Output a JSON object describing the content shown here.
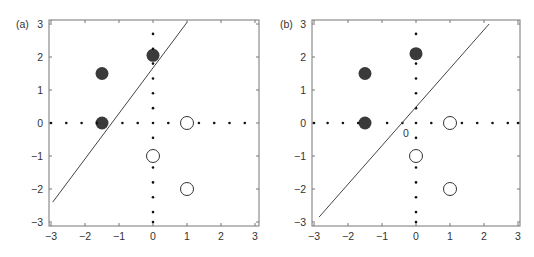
{
  "chart_data": [
    {
      "type": "scatter",
      "panel_label": "(a)",
      "title": "",
      "xlabel": "",
      "ylabel": "",
      "xlim": [
        -3,
        3
      ],
      "ylim": [
        -3,
        3
      ],
      "xticks": [
        "-3",
        "-2",
        "-1",
        "0",
        "1",
        "2",
        "3"
      ],
      "yticks": [
        "3",
        "2",
        "1",
        "0",
        "-1",
        "-2",
        "-3"
      ],
      "grid": false,
      "series": [
        {
          "name": "filled",
          "marker": "filled-circle",
          "color": "#3a3a3a",
          "points": [
            [
              -1.5,
              1.5
            ],
            [
              0,
              2.05
            ],
            [
              -1.5,
              0
            ]
          ]
        },
        {
          "name": "open",
          "marker": "open-circle",
          "color": "#333333",
          "points": [
            [
              1,
              0
            ],
            [
              0,
              -1
            ],
            [
              1,
              -2
            ]
          ]
        },
        {
          "name": "dotted-x-axis",
          "marker": "dot",
          "points": [
            [
              -3,
              0
            ],
            [
              -2.55,
              0
            ],
            [
              -2.1,
              0
            ],
            [
              -1.65,
              0
            ],
            [
              -0.9,
              0
            ],
            [
              -0.45,
              0
            ],
            [
              0,
              0
            ],
            [
              0.45,
              0
            ],
            [
              1.35,
              0
            ],
            [
              1.8,
              0
            ],
            [
              2.25,
              0
            ],
            [
              2.7,
              0
            ]
          ]
        },
        {
          "name": "dotted-y-axis",
          "marker": "dot",
          "points": [
            [
              0,
              2.7
            ],
            [
              0,
              2.25
            ],
            [
              0,
              1.8
            ],
            [
              0,
              1.35
            ],
            [
              0,
              0.9
            ],
            [
              0,
              0.45
            ],
            [
              0,
              -0.45
            ],
            [
              0,
              -1.35
            ],
            [
              0,
              -1.8
            ],
            [
              0,
              -2.25
            ],
            [
              0,
              -2.7
            ],
            [
              0,
              -3
            ]
          ]
        },
        {
          "name": "decision-boundary",
          "type": "line",
          "points": [
            [
              -2.95,
              -2.4
            ],
            [
              1.0,
              3.05
            ]
          ]
        }
      ],
      "annotations": []
    },
    {
      "type": "scatter",
      "panel_label": "(b)",
      "title": "",
      "xlabel": "",
      "ylabel": "",
      "xlim": [
        -3,
        3
      ],
      "ylim": [
        -3,
        3
      ],
      "xticks": [
        "-3",
        "-2",
        "-1",
        "0",
        "1",
        "2",
        "3"
      ],
      "yticks": [
        "3",
        "2",
        "1",
        "0",
        "-1",
        "-2",
        "-3"
      ],
      "grid": false,
      "series": [
        {
          "name": "filled",
          "marker": "filled-circle",
          "color": "#3a3a3a",
          "points": [
            [
              -1.5,
              1.5
            ],
            [
              0,
              2.1
            ],
            [
              -1.5,
              0
            ]
          ]
        },
        {
          "name": "open",
          "marker": "open-circle",
          "color": "#333333",
          "points": [
            [
              1,
              0
            ],
            [
              0,
              -1
            ],
            [
              1,
              -2
            ]
          ]
        },
        {
          "name": "dotted-x-axis",
          "marker": "dot",
          "points": [
            [
              -3,
              0
            ],
            [
              -2.6,
              0
            ],
            [
              -2.15,
              0
            ],
            [
              -1.7,
              0
            ],
            [
              -0.85,
              0
            ],
            [
              -0.4,
              0
            ],
            [
              0,
              0
            ],
            [
              0.45,
              0
            ],
            [
              1.35,
              0
            ],
            [
              1.8,
              0
            ],
            [
              2.25,
              0
            ],
            [
              2.7,
              0
            ],
            [
              3,
              0
            ]
          ]
        },
        {
          "name": "dotted-y-axis",
          "marker": "dot",
          "points": [
            [
              0,
              2.7
            ],
            [
              0,
              1.8
            ],
            [
              0,
              1.35
            ],
            [
              0,
              0.9
            ],
            [
              0,
              0.45
            ],
            [
              0,
              -0.45
            ],
            [
              0,
              -1.35
            ],
            [
              0,
              -1.8
            ],
            [
              0,
              -2.25
            ],
            [
              0,
              -2.7
            ],
            [
              0,
              -3
            ]
          ]
        },
        {
          "name": "decision-boundary",
          "type": "line",
          "points": [
            [
              -2.85,
              -2.85
            ],
            [
              2.15,
              3.0
            ]
          ]
        }
      ],
      "annotations": [
        {
          "text": "0",
          "x": -0.3,
          "y": -0.3
        }
      ]
    }
  ]
}
